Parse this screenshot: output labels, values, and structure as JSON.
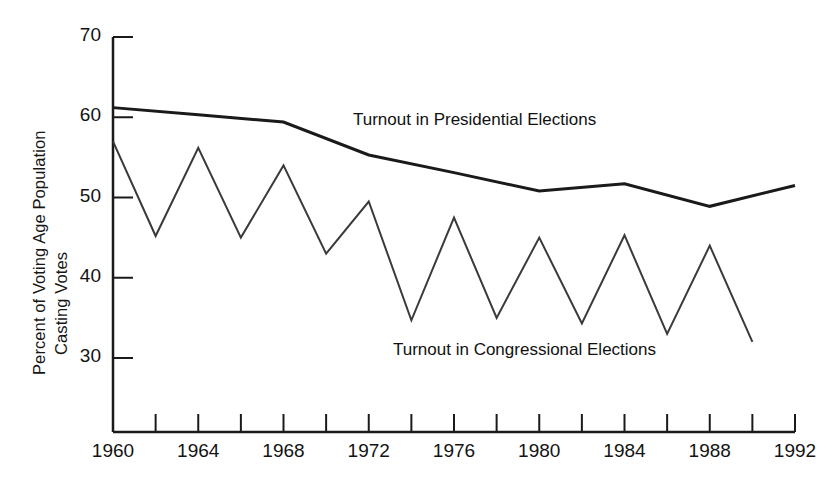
{
  "chart_data": {
    "type": "line",
    "title": "",
    "xlabel": "",
    "ylabel": "Percent of Voting Age Population Casting Votes",
    "xlim": [
      1960,
      1992
    ],
    "ylim": [
      30,
      70
    ],
    "grid": false,
    "legend_position": "inline-annotation",
    "x_tick_labels": [
      "1960",
      "1964",
      "1968",
      "1972",
      "1976",
      "1980",
      "1984",
      "1988",
      "1992"
    ],
    "x_tick_values": [
      1960,
      1964,
      1968,
      1972,
      1976,
      1980,
      1984,
      1988,
      1992
    ],
    "x_minor_tick_values": [
      1962,
      1966,
      1970,
      1974,
      1978,
      1982,
      1986,
      1990
    ],
    "y_tick_labels": [
      "70",
      "60",
      "50",
      "40",
      "30"
    ],
    "y_tick_values": [
      70,
      60,
      50,
      40,
      30
    ],
    "series": [
      {
        "name": "Turnout in Presidential Elections",
        "x": [
          1960,
          1964,
          1968,
          1972,
          1976,
          1980,
          1984,
          1988,
          1992
        ],
        "values": [
          61.2,
          60.3,
          59.4,
          55.3,
          53.1,
          50.8,
          51.7,
          48.9,
          51.5
        ],
        "color": "#1a1a1a",
        "width": 3
      },
      {
        "name": "Turnout in Congressional Elections",
        "x": [
          1960,
          1962,
          1964,
          1966,
          1968,
          1970,
          1972,
          1974,
          1976,
          1978,
          1980,
          1982,
          1984,
          1986,
          1988,
          1990
        ],
        "values": [
          57.0,
          45.2,
          56.2,
          45.0,
          54.0,
          43.0,
          49.5,
          34.7,
          47.5,
          35.0,
          45.0,
          34.3,
          45.3,
          33.0,
          44.0,
          32.0
        ],
        "color": "#3a3a3a",
        "width": 2
      }
    ]
  },
  "axis": {
    "y_title_line1": "Percent of Voting Age Population",
    "y_title_line2": "Casting Votes"
  },
  "annotations": {
    "presidential": "Turnout in Presidential Elections",
    "congressional": "Turnout in Congressional Elections"
  },
  "colors": {
    "background": "#ffffff",
    "axis": "#1a1a1a",
    "presidential_line": "#1a1a1a",
    "congressional_line": "#3a3a3a"
  }
}
